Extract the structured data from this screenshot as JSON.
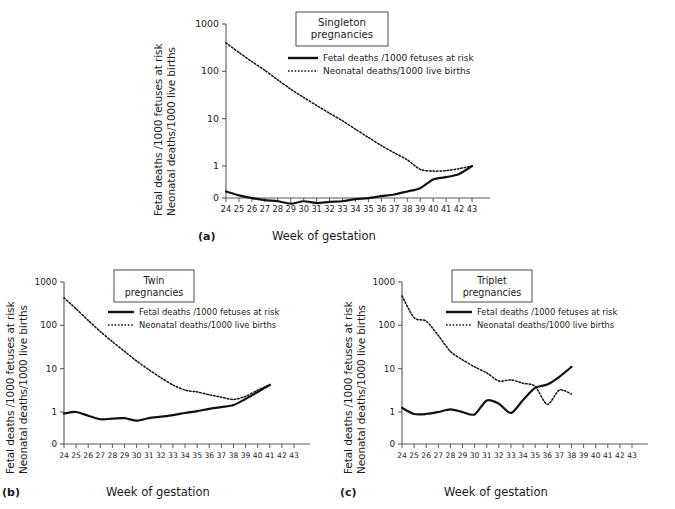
{
  "figure": {
    "xlabel": "Week of gestation",
    "ylabel_line1": "Fetal deaths /1000 fetuses at risk",
    "ylabel_line2": "Neonatal deaths/1000 live births",
    "legend": {
      "fetal": "Fetal deaths /1000 fetuses at risk",
      "neonatal": "Neonatal deaths/1000 live births"
    },
    "ytick_labels": [
      "1000",
      "100",
      "10",
      "1",
      "0"
    ],
    "xtick_labels": [
      "24",
      "25",
      "26",
      "27",
      "28",
      "29",
      "30",
      "31",
      "32",
      "33",
      "34",
      "35",
      "36",
      "37",
      "38",
      "39",
      "40",
      "41",
      "42",
      "43"
    ],
    "panel_letters": {
      "a": "(a)",
      "b": "(b)",
      "c": "(c)"
    },
    "colors": {
      "line": "#111111",
      "axis": "#5a5a5a",
      "text": "#1a1a1a"
    }
  },
  "chart_data": [
    {
      "type": "line",
      "panel": "a",
      "title": "Singleton\npregnancies",
      "title_line1": "Singleton",
      "title_line2": "pregnancies",
      "xlabel": "Week of gestation",
      "ylabel": "Fetal deaths /1000 fetuses at risk / Neonatal deaths/1000 live births",
      "yscale": "log",
      "ylim": [
        0.1,
        1000
      ],
      "yticks": [
        1000,
        100,
        10,
        1
      ],
      "xlim": [
        24,
        43
      ],
      "grid": false,
      "legend_position": "upper right",
      "x": [
        24,
        25,
        26,
        27,
        28,
        29,
        30,
        31,
        32,
        33,
        34,
        35,
        36,
        37,
        38,
        39,
        40,
        41,
        42,
        43
      ],
      "series": [
        {
          "name": "Fetal deaths /1000 fetuses at risk",
          "style": "solid",
          "values": [
            0.29,
            0.24,
            0.21,
            0.19,
            0.18,
            0.16,
            0.18,
            0.165,
            0.175,
            0.18,
            0.2,
            0.21,
            0.23,
            0.25,
            0.29,
            0.34,
            0.52,
            0.58,
            0.68,
            1.0
          ]
        },
        {
          "name": "Neonatal deaths/1000 live births",
          "style": "dotted",
          "values": [
            400,
            250,
            160,
            105,
            66,
            42,
            28,
            19,
            13,
            9.0,
            6.0,
            4.0,
            2.7,
            1.9,
            1.35,
            0.85,
            0.78,
            0.8,
            0.88,
            1.0
          ]
        }
      ]
    },
    {
      "type": "line",
      "panel": "b",
      "title_line1": "Twin",
      "title_line2": "pregnancies",
      "xlabel": "Week of gestation",
      "ylabel": "Fetal deaths /1000 fetuses at risk / Neonatal deaths/1000 live births",
      "yscale": "log",
      "ylim": [
        0.3,
        1000
      ],
      "yticks": [
        1000,
        100,
        10,
        1
      ],
      "xlim": [
        24,
        43
      ],
      "grid": false,
      "legend_position": "upper right",
      "x": [
        24,
        25,
        26,
        27,
        28,
        29,
        30,
        31,
        32,
        33,
        34,
        35,
        36,
        37,
        38,
        39,
        40,
        41
      ],
      "series": [
        {
          "name": "Fetal deaths /1000 fetuses at risk",
          "style": "solid",
          "values": [
            0.92,
            1.0,
            0.82,
            0.68,
            0.7,
            0.72,
            0.63,
            0.72,
            0.78,
            0.85,
            0.95,
            1.05,
            1.18,
            1.3,
            1.45,
            2.0,
            2.9,
            4.2
          ]
        },
        {
          "name": "Neonatal deaths/1000 live births",
          "style": "dotted",
          "values": [
            430,
            240,
            130,
            72,
            42,
            25,
            15,
            9.5,
            6.2,
            4.2,
            3.2,
            2.9,
            2.5,
            2.2,
            1.95,
            2.3,
            3.2,
            4.3
          ]
        }
      ]
    },
    {
      "type": "line",
      "panel": "c",
      "title_line1": "Triplet",
      "title_line2": "pregnancies",
      "xlabel": "Week of gestation",
      "ylabel": "Fetal deaths /1000 fetuses at risk / Neonatal deaths/1000 live births",
      "yscale": "log",
      "ylim": [
        0.3,
        1000
      ],
      "yticks": [
        1000,
        100,
        10,
        1
      ],
      "xlim": [
        24,
        43
      ],
      "grid": false,
      "legend_position": "upper right",
      "x": [
        24,
        25,
        26,
        27,
        28,
        29,
        30,
        31,
        32,
        33,
        34,
        35,
        36,
        37,
        38
      ],
      "series": [
        {
          "name": "Fetal deaths /1000 fetuses at risk",
          "style": "solid",
          "values": [
            1.25,
            0.9,
            0.9,
            1.0,
            1.15,
            1.0,
            0.88,
            1.85,
            1.55,
            0.95,
            1.9,
            3.6,
            4.3,
            6.5,
            11.0
          ]
        },
        {
          "name": "Neonatal deaths/1000 live births",
          "style": "dotted",
          "values": [
            480,
            150,
            125,
            58,
            25,
            16,
            11,
            8.0,
            5.2,
            5.5,
            4.6,
            3.9,
            1.5,
            3.2,
            2.6
          ]
        }
      ]
    }
  ]
}
